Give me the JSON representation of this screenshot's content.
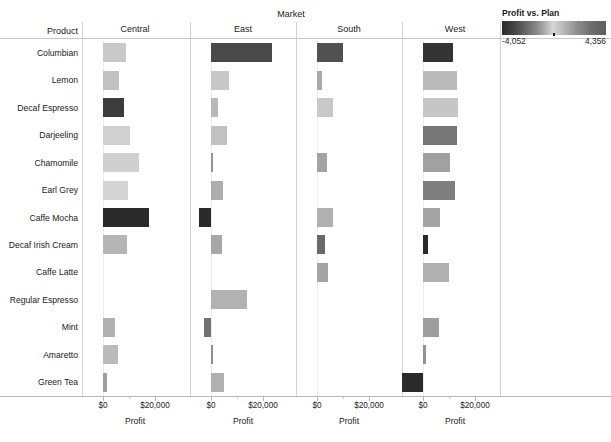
{
  "header": {
    "market_title": "Market",
    "product_header": "Product"
  },
  "legend": {
    "title": "Profit vs. Plan",
    "min_label": "-4,052",
    "max_label": "4,356",
    "min_value": -4052,
    "max_value": 4356,
    "color_dark": "#2a2a2a",
    "color_light": "#d6d6d6"
  },
  "axis": {
    "title": "Profit",
    "tick_labels": [
      "$0",
      "$20,000"
    ],
    "tick_values": [
      0,
      20000
    ]
  },
  "chart_data": {
    "type": "bar",
    "title": "Market",
    "xlabel": "Profit",
    "ylabel": "Product",
    "legend_title": "Profit vs. Plan",
    "legend_position": "top-right",
    "grid": false,
    "xlim": [
      -8000,
      30000
    ],
    "categories": [
      "Columbian",
      "Lemon",
      "Decaf Espresso",
      "Darjeeling",
      "Chamomile",
      "Earl Grey",
      "Caffe Mocha",
      "Decaf Irish Cream",
      "Caffe Latte",
      "Regular Espresso",
      "Mint",
      "Amaretto",
      "Green Tea"
    ],
    "panels": [
      "Central",
      "East",
      "South",
      "West"
    ],
    "series": [
      {
        "name": "Central",
        "values": [
          8700,
          6200,
          8200,
          10500,
          14000,
          9600,
          17500,
          9200,
          0,
          0,
          4500,
          5800,
          1400
        ],
        "color_values": [
          600,
          900,
          -3600,
          0,
          400,
          100,
          -4052,
          1300,
          null,
          null,
          1500,
          1100,
          2100
        ]
      },
      {
        "name": "East",
        "values": [
          23600,
          6900,
          2500,
          6200,
          700,
          4700,
          -4500,
          4200,
          0,
          13800,
          -2600,
          600,
          5000
        ],
        "color_values": [
          -3300,
          -200,
          1200,
          900,
          2400,
          1600,
          -4052,
          1800,
          null,
          1400,
          -2300,
          2600,
          1500
        ]
      },
      {
        "name": "South",
        "values": [
          10000,
          2100,
          6300,
          0,
          4000,
          0,
          6200,
          3100,
          4100,
          0,
          0,
          0,
          0
        ],
        "color_values": [
          -3100,
          1700,
          600,
          null,
          1900,
          null,
          1500,
          -2500,
          1900,
          null,
          null,
          null,
          null
        ]
      },
      {
        "name": "West",
        "values": [
          11700,
          13200,
          13500,
          13000,
          10400,
          12400,
          6500,
          1900,
          10000,
          0,
          6000,
          1200,
          -8500
        ],
        "color_values": [
          -3800,
          -500,
          700,
          -2200,
          2000,
          -2000,
          1900,
          -4052,
          1500,
          null,
          2100,
          -1500,
          -4052
        ]
      }
    ]
  },
  "rows": [
    {
      "label": "Columbian"
    },
    {
      "label": "Lemon"
    },
    {
      "label": "Decaf Espresso"
    },
    {
      "label": "Darjeeling"
    },
    {
      "label": "Chamomile"
    },
    {
      "label": "Earl Grey"
    },
    {
      "label": "Caffe Mocha"
    },
    {
      "label": "Decaf Irish Cream"
    },
    {
      "label": "Caffe Latte"
    },
    {
      "label": "Regular Espresso"
    },
    {
      "label": "Mint"
    },
    {
      "label": "Amaretto"
    },
    {
      "label": "Green Tea"
    }
  ],
  "columns": [
    {
      "label": "Central"
    },
    {
      "label": "East"
    },
    {
      "label": "South"
    },
    {
      "label": "West"
    }
  ]
}
